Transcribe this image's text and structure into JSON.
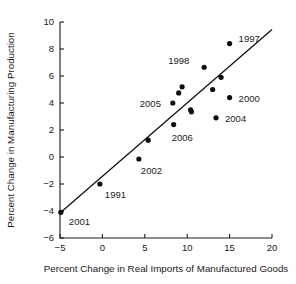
{
  "chart_data": {
    "type": "scatter",
    "title": "",
    "xlabel": "Percent Change in Real Imports of Manufactured Goods",
    "ylabel": "Percent Change in Manufacturing Production",
    "xlim": [
      -5,
      20
    ],
    "ylim": [
      -6,
      10
    ],
    "xticks": [
      -5,
      0,
      5,
      10,
      15,
      20
    ],
    "yticks": [
      -6,
      -4,
      -2,
      0,
      2,
      4,
      6,
      8,
      10
    ],
    "xtick_labels": [
      "−5",
      "0",
      "5",
      "10",
      "15",
      "20"
    ],
    "ytick_labels": [
      "−6",
      "−4",
      "−2",
      "0",
      "2",
      "4",
      "6",
      "8",
      "10"
    ],
    "grid": false,
    "legend": "none",
    "marker_color": "#0d0d0d",
    "line_color": "#0d0d0d",
    "points": [
      {
        "x": -4.9,
        "y": -4.1,
        "label": "2001",
        "label_dx": 8,
        "label_dy": 13
      },
      {
        "x": -0.3,
        "y": -2.0,
        "label": "1991",
        "label_dx": 5,
        "label_dy": 14
      },
      {
        "x": 4.3,
        "y": -0.15,
        "label": "2002",
        "label_dx": 2,
        "label_dy": 15
      },
      {
        "x": 5.4,
        "y": 1.25,
        "label": "",
        "label_dx": 0,
        "label_dy": 0
      },
      {
        "x": 8.4,
        "y": 2.4,
        "label": "2006",
        "label_dx": -2,
        "label_dy": 16
      },
      {
        "x": 8.3,
        "y": 4.0,
        "label": "2005",
        "label_dx": -33,
        "label_dy": 4
      },
      {
        "x": 9.0,
        "y": 4.75,
        "label": "",
        "label_dx": 0,
        "label_dy": 0
      },
      {
        "x": 9.4,
        "y": 5.2,
        "label": "",
        "label_dx": 0,
        "label_dy": 0
      },
      {
        "x": 10.4,
        "y": 3.5,
        "label": "",
        "label_dx": 0,
        "label_dy": 0
      },
      {
        "x": 10.5,
        "y": 3.35,
        "label": "",
        "label_dx": 0,
        "label_dy": 0
      },
      {
        "x": 12.0,
        "y": 6.65,
        "label": "1998",
        "label_dx": -36,
        "label_dy": -3
      },
      {
        "x": 13.0,
        "y": 5.0,
        "label": "",
        "label_dx": 0,
        "label_dy": 0
      },
      {
        "x": 13.4,
        "y": 2.9,
        "label": "2004",
        "label_dx": 9,
        "label_dy": 4
      },
      {
        "x": 14.0,
        "y": 5.9,
        "label": "",
        "label_dx": 0,
        "label_dy": 0
      },
      {
        "x": 15.0,
        "y": 4.4,
        "label": "2000",
        "label_dx": 9,
        "label_dy": 4
      },
      {
        "x": 15.0,
        "y": 8.4,
        "label": "1997",
        "label_dx": 9,
        "label_dy": -2
      }
    ],
    "fit_line": {
      "x1": -5.0,
      "y1": -4.15,
      "x2": 20.0,
      "y2": 9.45
    }
  }
}
